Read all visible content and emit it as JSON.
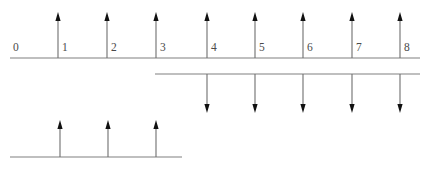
{
  "figure": {
    "background_color": "#ffffff",
    "line_color": "#808080",
    "stem_color": "#6e6e6e",
    "arrow_color": "#111111",
    "label_color": "#4a4a4a",
    "width": 428,
    "height": 170
  },
  "chart_data": {
    "type": "scatter",
    "title": "",
    "xlabel": "",
    "ylabel": "",
    "grid": false,
    "legend": null,
    "axis_count": 3,
    "xlim": [
      0,
      8
    ],
    "tick_labels": [
      "0",
      "1",
      "2",
      "3",
      "4",
      "5",
      "6",
      "7",
      "8"
    ],
    "tick_values": [
      0,
      1,
      2,
      3,
      4,
      5,
      6,
      7,
      8
    ],
    "series": [
      {
        "name": "upper-impulse-train",
        "direction": "up",
        "axis": 1,
        "x": [
          1,
          2,
          3,
          4,
          5,
          6,
          7,
          8
        ],
        "values": [
          1,
          1,
          1,
          1,
          1,
          1,
          1,
          1
        ]
      },
      {
        "name": "middle-impulse-train",
        "direction": "down",
        "axis": 2,
        "x": [
          4,
          5,
          6,
          7,
          8
        ],
        "values": [
          -1,
          -1,
          -1,
          -1,
          -1
        ]
      },
      {
        "name": "lower-impulse-train",
        "direction": "up",
        "axis": 3,
        "x": [
          1,
          2,
          3
        ],
        "values": [
          1,
          1,
          1
        ]
      }
    ]
  },
  "axes": [
    {
      "name": "upper-axis",
      "x_start": 10,
      "x_end": 420,
      "baseline_y": 58,
      "labels": [
        {
          "text": "0",
          "x": 13,
          "y": 51
        },
        {
          "text": "1",
          "x": 62,
          "y": 51
        },
        {
          "text": "2",
          "x": 111,
          "y": 51
        },
        {
          "text": "3",
          "x": 160,
          "y": 51
        },
        {
          "text": "4",
          "x": 211,
          "y": 51
        },
        {
          "text": "5",
          "x": 259,
          "y": 51
        },
        {
          "text": "6",
          "x": 307,
          "y": 51
        },
        {
          "text": "7",
          "x": 356,
          "y": 51
        },
        {
          "text": "8",
          "x": 404,
          "y": 51
        }
      ],
      "arrows": [
        {
          "x": 58,
          "tip_y": 12
        },
        {
          "x": 107,
          "tip_y": 12
        },
        {
          "x": 156,
          "tip_y": 12
        },
        {
          "x": 207,
          "tip_y": 12
        },
        {
          "x": 255,
          "tip_y": 12
        },
        {
          "x": 303,
          "tip_y": 12
        },
        {
          "x": 352,
          "tip_y": 12
        },
        {
          "x": 400,
          "tip_y": 12
        }
      ]
    },
    {
      "name": "middle-axis",
      "x_start": 155,
      "x_end": 420,
      "baseline_y": 74,
      "labels": [],
      "arrows": [
        {
          "x": 207,
          "tip_y": 113
        },
        {
          "x": 255,
          "tip_y": 113
        },
        {
          "x": 303,
          "tip_y": 113
        },
        {
          "x": 352,
          "tip_y": 113
        },
        {
          "x": 400,
          "tip_y": 113
        }
      ]
    },
    {
      "name": "lower-axis",
      "x_start": 10,
      "x_end": 182,
      "baseline_y": 157,
      "labels": [],
      "arrows": [
        {
          "x": 60,
          "tip_y": 120
        },
        {
          "x": 108,
          "tip_y": 120
        },
        {
          "x": 156,
          "tip_y": 120
        }
      ]
    }
  ]
}
